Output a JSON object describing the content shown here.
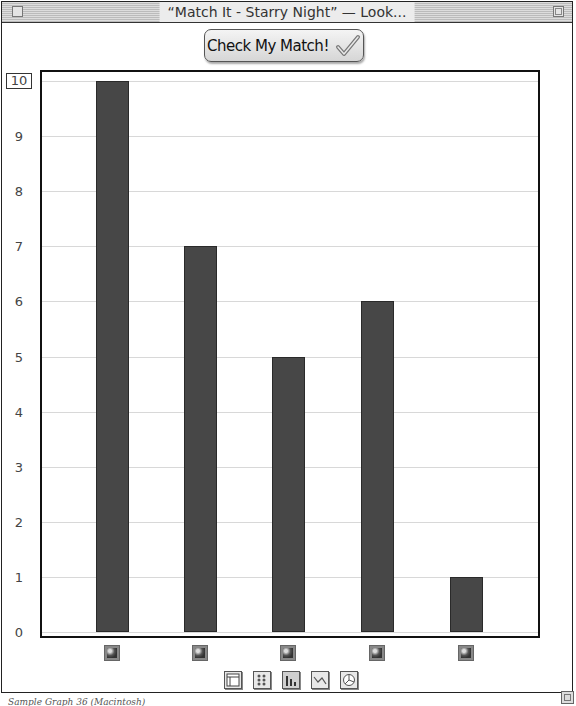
{
  "window": {
    "title": "“Match It - Starry Night” — Look..."
  },
  "toolbar": {
    "check_button_label": "Check My Match!"
  },
  "caption": "Sample Graph 36 (Macintosh)",
  "chart_data": {
    "type": "bar",
    "title": "",
    "xlabel": "",
    "ylabel": "",
    "categories": [
      "Item 1",
      "Item 2",
      "Item 3",
      "Item 4",
      "Item 5"
    ],
    "category_labels_are_icons": true,
    "values": [
      10,
      7,
      5,
      6,
      1
    ],
    "ylim": [
      0,
      10
    ],
    "yticks": [
      0,
      1,
      2,
      3,
      4,
      5,
      6,
      7,
      8,
      9,
      10
    ],
    "grid": true,
    "legend": null,
    "bar_color": "#474747"
  },
  "view_tools": [
    {
      "name": "table-view",
      "active": false
    },
    {
      "name": "pictograph-view",
      "active": false
    },
    {
      "name": "bar-chart-view",
      "active": true
    },
    {
      "name": "line-chart-view",
      "active": false
    },
    {
      "name": "pie-chart-view",
      "active": false
    }
  ]
}
